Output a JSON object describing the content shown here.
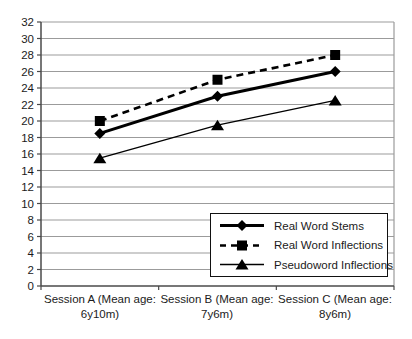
{
  "chart_data": {
    "type": "line",
    "title": "",
    "xlabel": "",
    "ylabel": "",
    "ylim": [
      0,
      32
    ],
    "ytick_step": 2,
    "yticks": [
      0,
      2,
      4,
      6,
      8,
      10,
      12,
      14,
      16,
      18,
      20,
      22,
      24,
      26,
      28,
      30,
      32
    ],
    "grid": true,
    "legend_position": "inside-bottom-right",
    "categories": [
      {
        "line1": "Session A (Mean age:",
        "line2": "6y10m)"
      },
      {
        "line1": "Session B (Mean age:",
        "line2": "7y6m)"
      },
      {
        "line1": "Session C (Mean age:",
        "line2": "8y6m)"
      }
    ],
    "series": [
      {
        "name": "Real Word Stems",
        "marker": "diamond",
        "line_style": "solid-thick",
        "values": [
          18.5,
          23,
          26
        ]
      },
      {
        "name": "Real Word Inflections",
        "marker": "square",
        "line_style": "dashed",
        "values": [
          20,
          25,
          28
        ]
      },
      {
        "name": "Pseudoword Inflections",
        "marker": "triangle",
        "line_style": "solid-thin",
        "values": [
          15.5,
          19.5,
          22.5
        ]
      }
    ],
    "colors": {
      "series": "#000000",
      "gridline": "#9b9b9b",
      "axis": "#4a4a4a",
      "text": "#1b1b1b",
      "legend_border": "#111111",
      "background": "#ffffff"
    }
  }
}
